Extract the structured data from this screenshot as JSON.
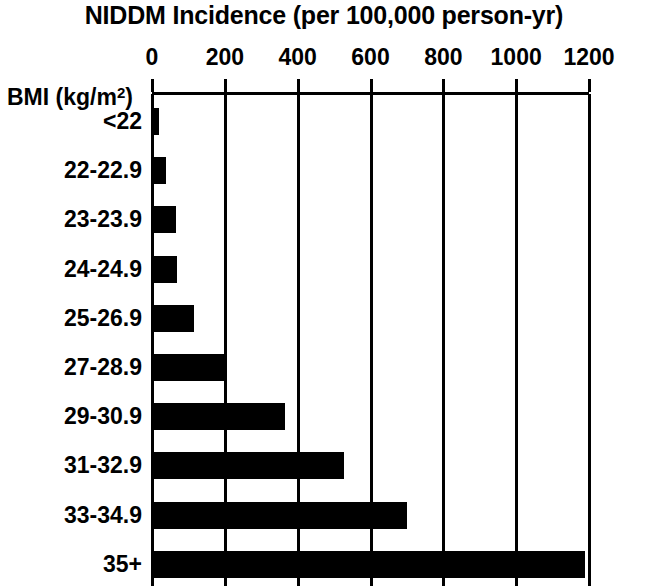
{
  "chart_data": {
    "type": "bar",
    "orientation": "horizontal",
    "title": "NIDDM Incidence (per 100,000 person-yr)",
    "xlabel": "NIDDM Incidence (per 100,000 person-yr)",
    "ylabel": "BMI (kg/m²)",
    "ylabel_base": "BMI (kg/m",
    "ylabel_sup": "2",
    "ylabel_close": ")",
    "categories": [
      "<22",
      "22-22.9",
      "23-23.9",
      "24-24.9",
      "25-26.9",
      "27-28.9",
      "29-30.9",
      "31-32.9",
      "33-34.9",
      "35+"
    ],
    "values": [
      19,
      38,
      66,
      68,
      115,
      204,
      366,
      528,
      700,
      1190
    ],
    "xlim": [
      0,
      1200
    ],
    "xticks": [
      0,
      200,
      400,
      600,
      800,
      1000,
      1200
    ],
    "xtick_labels": [
      "0",
      "200",
      "400",
      "600",
      "800",
      "1000",
      "1200"
    ],
    "grid": "vertical",
    "legend": "none",
    "bar_color": "#000000",
    "axis_color": "#000000",
    "background": "#ffffff"
  }
}
